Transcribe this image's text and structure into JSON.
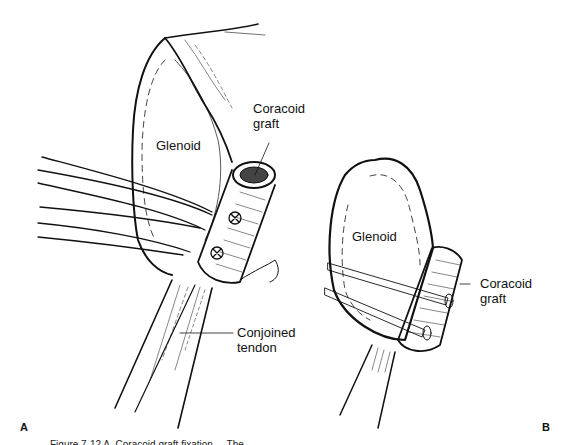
{
  "figure": {
    "panel_a": {
      "letter": "A",
      "labels": {
        "glenoid": "Glenoid",
        "graft_line1": "Coracoid",
        "graft_line2": "graft",
        "tendon_line1": "Conjoined",
        "tendon_line2": "tendon"
      }
    },
    "panel_b": {
      "letter": "B",
      "labels": {
        "glenoid": "Glenoid",
        "graft_line1": "Coracoid",
        "graft_line2": "graft"
      }
    },
    "caption_partial": "Figure 7-12  A, Coracoid graft fixation ... The"
  }
}
